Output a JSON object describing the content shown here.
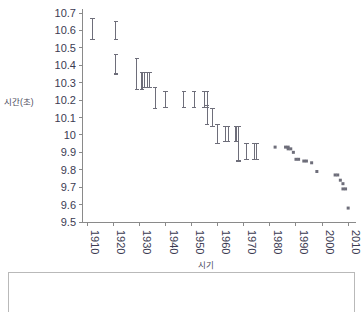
{
  "chart_data": {
    "type": "scatter",
    "title": "",
    "xlabel": "시기",
    "ylabel": "시간(초)",
    "xlim": [
      1908,
      2013
    ],
    "ylim": [
      9.5,
      10.7
    ],
    "grid": false,
    "legend": null,
    "xticks": [
      1910,
      1920,
      1930,
      1940,
      1950,
      1960,
      1970,
      1980,
      1990,
      2000,
      2010
    ],
    "yticks": [
      9.5,
      9.6,
      9.7,
      9.8,
      9.9,
      10,
      10.1,
      10.2,
      10.3,
      10.4,
      10.5,
      10.6,
      10.7
    ],
    "xtick_rotation": 90,
    "series": [
      {
        "name": "range-bars",
        "marker": "vertical-range-bar",
        "points": [
          {
            "x": 1912,
            "low": 10.55,
            "high": 10.67
          },
          {
            "x": 1921,
            "low": 10.55,
            "high": 10.65
          },
          {
            "x": 1921,
            "low": 10.35,
            "high": 10.46
          },
          {
            "x": 1929,
            "low": 10.26,
            "high": 10.44
          },
          {
            "x": 1931,
            "low": 10.26,
            "high": 10.36
          },
          {
            "x": 1932,
            "low": 10.27,
            "high": 10.36
          },
          {
            "x": 1933,
            "low": 10.27,
            "high": 10.36
          },
          {
            "x": 1934,
            "low": 10.27,
            "high": 10.36
          },
          {
            "x": 1936,
            "low": 10.15,
            "high": 10.27
          },
          {
            "x": 1940,
            "low": 10.16,
            "high": 10.25
          },
          {
            "x": 1947,
            "low": 10.16,
            "high": 10.25
          },
          {
            "x": 1951,
            "low": 10.16,
            "high": 10.25
          },
          {
            "x": 1955,
            "low": 10.16,
            "high": 10.25
          },
          {
            "x": 1956,
            "low": 10.16,
            "high": 10.25
          },
          {
            "x": 1956,
            "low": 10.06,
            "high": 10.17
          },
          {
            "x": 1958,
            "low": 10.05,
            "high": 10.15
          },
          {
            "x": 1960,
            "low": 9.95,
            "high": 10.06
          },
          {
            "x": 1963,
            "low": 9.96,
            "high": 10.05
          },
          {
            "x": 1964,
            "low": 9.96,
            "high": 10.05
          },
          {
            "x": 1967,
            "low": 9.96,
            "high": 10.05
          },
          {
            "x": 1968,
            "low": 9.85,
            "high": 10.05
          },
          {
            "x": 1971,
            "low": 9.86,
            "high": 9.95
          },
          {
            "x": 1974,
            "low": 9.86,
            "high": 9.95
          },
          {
            "x": 1975,
            "low": 9.86,
            "high": 9.95
          }
        ]
      },
      {
        "name": "record-points",
        "marker": "square-dot",
        "points": [
          {
            "x": 1982,
            "y": 9.93
          },
          {
            "x": 1986,
            "y": 9.93
          },
          {
            "x": 1987,
            "y": 9.93
          },
          {
            "x": 1987,
            "y": 9.92
          },
          {
            "x": 1988,
            "y": 9.92
          },
          {
            "x": 1989,
            "y": 9.9
          },
          {
            "x": 1990,
            "y": 9.86
          },
          {
            "x": 1991,
            "y": 9.86
          },
          {
            "x": 1993,
            "y": 9.85
          },
          {
            "x": 1994,
            "y": 9.85
          },
          {
            "x": 1996,
            "y": 9.84
          },
          {
            "x": 1998,
            "y": 9.79
          },
          {
            "x": 2005,
            "y": 9.77
          },
          {
            "x": 2006,
            "y": 9.77
          },
          {
            "x": 2007,
            "y": 9.74
          },
          {
            "x": 2008,
            "y": 9.72
          },
          {
            "x": 2008,
            "y": 9.69
          },
          {
            "x": 2009,
            "y": 9.69
          },
          {
            "x": 2010,
            "y": 9.58
          }
        ]
      }
    ]
  },
  "axis": {
    "ylabel_text": "시간(초)",
    "xlabel_text": "시기"
  },
  "colors": {
    "axis": "#8a8a8a",
    "tick_text": "#3b3b52",
    "marker": "#6e6e7a",
    "panel_border": "#b9b9b9",
    "background": "#ffffff"
  }
}
